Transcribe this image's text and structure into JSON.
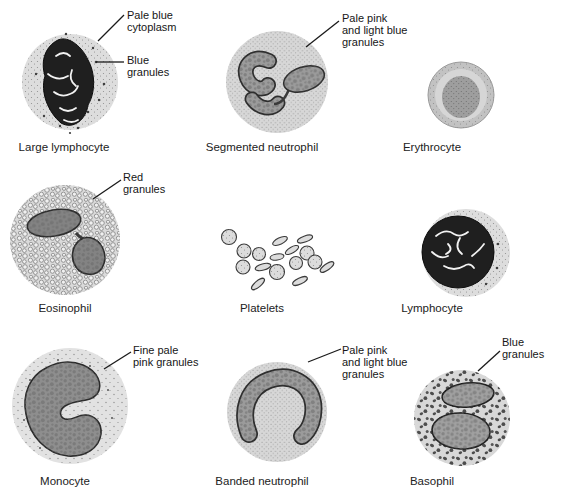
{
  "figure": {
    "type": "blood-cell-diagram",
    "cells": [
      {
        "id": "large-lymphocyte",
        "label": "Large lymphocyte",
        "annotations": [
          {
            "lines": [
              "Pale blue",
              "cytoplasm"
            ]
          },
          {
            "lines": [
              "Blue",
              "granules"
            ]
          }
        ]
      },
      {
        "id": "segmented-neutrophil",
        "label": "Segmented neutrophil",
        "annotations": [
          {
            "lines": [
              "Pale pink",
              "and light blue",
              "granules"
            ]
          }
        ]
      },
      {
        "id": "erythrocyte",
        "label": "Erythrocyte",
        "annotations": []
      },
      {
        "id": "eosinophil",
        "label": "Eosinophil",
        "annotations": [
          {
            "lines": [
              "Red",
              "granules"
            ]
          }
        ]
      },
      {
        "id": "platelets",
        "label": "Platelets",
        "annotations": []
      },
      {
        "id": "lymphocyte",
        "label": "Lymphocyte",
        "annotations": []
      },
      {
        "id": "monocyte",
        "label": "Monocyte",
        "annotations": [
          {
            "lines": [
              "Fine pale",
              "pink granules"
            ]
          }
        ]
      },
      {
        "id": "banded-neutrophil",
        "label": "Banded neutrophil",
        "annotations": [
          {
            "lines": [
              "Pale pink",
              "and light blue",
              "granules"
            ]
          }
        ]
      },
      {
        "id": "basophil",
        "label": "Basophil",
        "annotations": [
          {
            "lines": [
              "Blue",
              "granules"
            ]
          }
        ]
      }
    ],
    "colors": {
      "background": "#ffffff",
      "ink": "#1a1a1a",
      "cytoplasm_light": "#dcdcdc",
      "nucleus_gray": "#9b9b9b",
      "nucleus_dark": "#1f1f1f"
    }
  }
}
